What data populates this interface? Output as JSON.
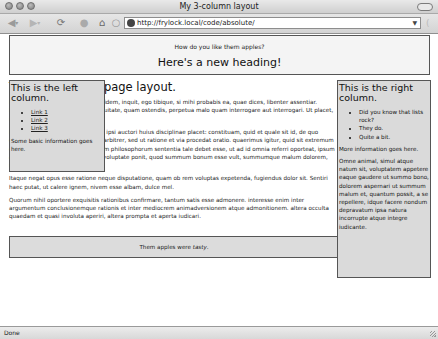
{
  "window": {
    "title": "My 3-column layout"
  },
  "toolbar": {
    "back_icon": "◀",
    "forward_icon": "▶",
    "reload_icon": "⟳",
    "stop_icon": "●",
    "home_icon": "⌂",
    "spinner_icon": "○",
    "url": "http://frylock.local/code/absolute/",
    "url_dropdown_icon": "▼",
    "sidebar_icon": "("
  },
  "page": {
    "header": {
      "subtitle": "How do you like them apples?",
      "heading": "Here's a new heading!"
    },
    "main": {
      "heading": "This is the main page layout.",
      "paragraphs": [
        "Lorem ipsum dolor sit amet, tu quidem, inquit, ego tibique, si mihi probabis ea, quae dices, libenter assentiar. Probabo, inquit, modo ista sis aequitate, quam ostendis, perpetua malo quam interrogare aut interrogari. Ut placet, inquam. Tum dicere exorsus est.",
        "Primum igitur, inquit, sic agam, ut ipsi auctori huius disciplinae placet: constituam, quid et quale sit id, de quo quaerimus, non quo ignorare vos arbitrer, sed ut ratione et via procedat oratio. quaerimus igitur, quid sit extremum et ultimum bonorum, quod omnium philosophorum sententia tale debet esse, ut ad id omnia referri oporteat, ipsum autem nusquam. hoc Epicurus in voluptate ponit, quod summum bonum esse vult, summumque malum dolorem, idque instituit docere sic.",
        "Itaque negat opus esse ratione neque disputatione, quam ob rem voluptas expetenda, fugiendus dolor sit. Sentiri haec putat, ut calere ignem, nivem esse albam, dulce mel.",
        "Quorum nihil oportere exquisitis rationibus confirmare, tantum satis esse admonere. interesse enim inter argumentum conclusionemque rationis et inter mediocrem animadversionem atque admonitionem. altera occulta quaedam et quasi involuta aperiri, altera prompta et aperta iudicari."
      ]
    },
    "left_column": {
      "title": "This is the left column.",
      "links": [
        "Link 1",
        "Link 2",
        "Link 3"
      ],
      "info": "Some basic information goes here."
    },
    "right_column": {
      "title": "This is the right column.",
      "items": [
        "Did you know that lists rock?",
        "They do.",
        "Quite a bit."
      ],
      "info": "More information goes here.",
      "paragraph": "Omne animal, simul atque natum sit, voluptatem appetere eaque gaudere ut summo bono, dolorem aspernari ut summum malum et, quantum possit, a se repellere, idque facere nondum depravatum ipsa natura incorrupte atque integre iudicante."
    },
    "footer": {
      "text_before": "Them apples were ",
      "text_emphasis": "tasty",
      "text_after": "."
    }
  },
  "statusbar": {
    "status": "Done"
  }
}
